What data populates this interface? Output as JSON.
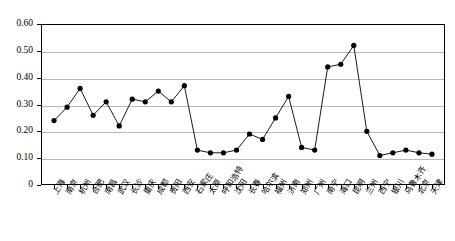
{
  "chart_data": {
    "type": "line",
    "title": "",
    "subtitle": "",
    "xlabel": "",
    "ylabel": "",
    "ylim": [
      0,
      0.6
    ],
    "ytick_labels": [
      "0.60",
      "0.50",
      "0.40",
      "0.30",
      "0.20",
      "0.10",
      "0"
    ],
    "ytick_values": [
      0.6,
      0.5,
      0.4,
      0.3,
      0.2,
      0.1,
      0
    ],
    "grid": true,
    "grid_axis": "y",
    "legend": false,
    "legend_position": "none",
    "marker": "filled-circle",
    "line_color": "#000000",
    "marker_color": "#000000",
    "categories": [
      "上海",
      "南京",
      "杭州",
      "合肥",
      "南昌",
      "武汉",
      "长沙",
      "重庆",
      "成都",
      "贵阳",
      "西安",
      "石家庄",
      "太原",
      "呼和浩特",
      "沈阳",
      "长春",
      "哈尔滨",
      "福州",
      "济南",
      "郑州",
      "广州",
      "南宁",
      "海口",
      "昆明",
      "兰州",
      "西宁",
      "银川",
      "乌鲁木齐",
      "北京",
      "天津"
    ],
    "values": [
      0.24,
      0.29,
      0.36,
      0.26,
      0.31,
      0.22,
      0.32,
      0.31,
      0.35,
      0.31,
      0.37,
      0.13,
      0.12,
      0.12,
      0.13,
      0.19,
      0.17,
      0.25,
      0.33,
      0.14,
      0.13,
      0.44,
      0.45,
      0.52,
      0.2,
      0.11,
      0.12,
      0.13,
      0.12,
      0.115
    ],
    "series": [
      {
        "name": "series-1",
        "values": [
          0.24,
          0.29,
          0.36,
          0.26,
          0.31,
          0.22,
          0.32,
          0.31,
          0.35,
          0.31,
          0.37,
          0.13,
          0.12,
          0.12,
          0.13,
          0.19,
          0.17,
          0.25,
          0.33,
          0.14,
          0.13,
          0.44,
          0.45,
          0.52,
          0.2,
          0.11,
          0.12,
          0.13,
          0.12,
          0.115
        ]
      }
    ],
    "last_category": "天津",
    "last_value": 0.115
  }
}
